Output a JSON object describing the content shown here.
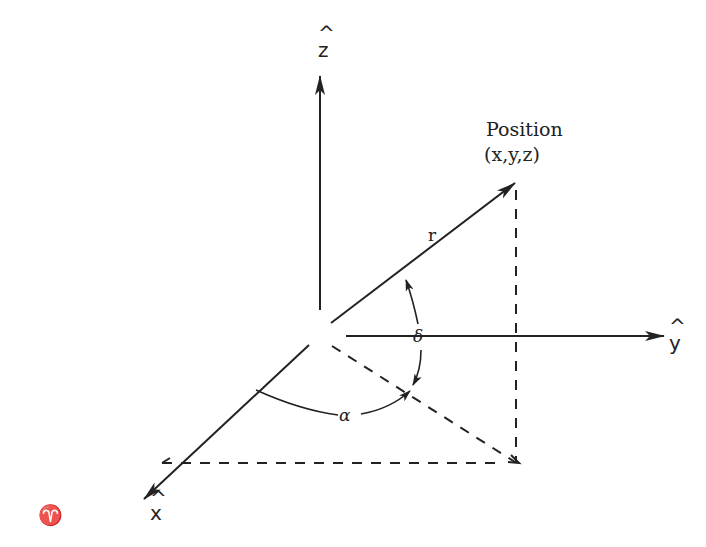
{
  "diagram": {
    "type": "3D coordinate system (spherical/celestial coordinates)",
    "colors": {
      "ink": "#222222",
      "background": "#ffffff"
    },
    "axes": {
      "z": {
        "label": "ẑ",
        "hat": "^",
        "letter": "z"
      },
      "y": {
        "label": "ŷ",
        "hat": "^",
        "letter": "y"
      },
      "x": {
        "label": "x̂",
        "hat": "^",
        "letter": "x"
      }
    },
    "vernal_equinox_symbol": "♈",
    "position": {
      "title": "Position",
      "coords": "(x,y,z)"
    },
    "radius_label": "r",
    "angles": {
      "alpha": "α",
      "delta": "δ"
    }
  }
}
